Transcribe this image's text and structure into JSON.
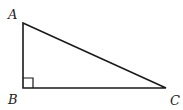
{
  "diagram": {
    "type": "right-triangle",
    "stroke_color": "#1a1a1a",
    "vertices": [
      {
        "label": "A",
        "x": 23,
        "y": 23
      },
      {
        "label": "B",
        "x": 23,
        "y": 88
      },
      {
        "label": "C",
        "x": 166,
        "y": 88
      }
    ],
    "right_angle_at": "B",
    "labels": {
      "a": "A",
      "b": "B",
      "c": "C"
    }
  }
}
